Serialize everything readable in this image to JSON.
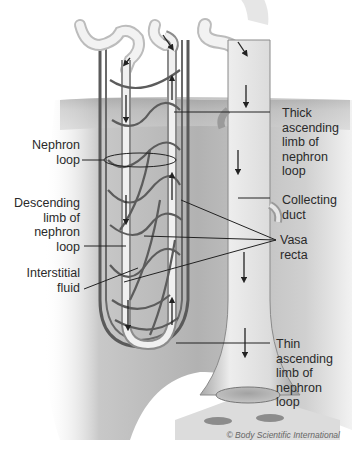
{
  "diagram": {
    "labels": {
      "thick_ascending": "Thick\nascending\nlimb of\nnephron\nloop",
      "nephron_loop": "Nephron\nloop",
      "collecting_duct": "Collecting\nduct",
      "descending_limb": "Descending\nlimb of\nnephron\nloop",
      "vasa_recta": "Vasa\nrecta",
      "interstitial_fluid": "Interstitial\nfluid",
      "thin_ascending": "Thin\nascending\nlimb of\nnephron\nloop"
    },
    "credit": "© Body Scientific International",
    "colors": {
      "background": "#ffffff",
      "tissue": "#b8b8b8",
      "tubule": "#e8e8e8",
      "vessel": "#555555",
      "leader_line": "#222222",
      "text": "#2a2a2a"
    }
  }
}
